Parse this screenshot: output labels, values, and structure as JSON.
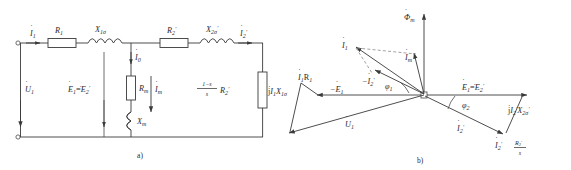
{
  "figure": {
    "caption_a": "a)",
    "caption_b": "b)"
  },
  "circuit": {
    "name": "induction-motor-equivalent-circuit",
    "labels": {
      "i1": "I",
      "i1_sub": "1",
      "r1": "R",
      "r1_sub": "1",
      "x1s": "X",
      "x1s_sub": "1σ",
      "i0": "I",
      "i0_sub": "0",
      "rm": "R",
      "rm_sub": "m",
      "xm": "X",
      "xm_sub": "m",
      "im": "I",
      "im_sub": "m",
      "e1": "E",
      "e1_sub": "1",
      "eq": "=",
      "e2p": "E",
      "e2p_sub": "2",
      "e2p_prime": "′",
      "u1": "U",
      "u1_sub": "1",
      "r2p": "R",
      "r2p_sub": "2",
      "r2p_prime": "′",
      "x2s": "X",
      "x2s_sub": "2σ",
      "x2s_prime": "′",
      "i2p": "I",
      "i2p_sub": "2",
      "i2p_prime": "′",
      "slip_num": "1−s",
      "slip_den": "s",
      "slip_res": "R",
      "slip_res_sub": "2",
      "slip_res_prime": "′"
    }
  },
  "phasor": {
    "name": "induction-motor-phasor-diagram",
    "labels": {
      "phi_m": "Φ",
      "phi_m_sub": "m",
      "i1": "I",
      "i1_sub": "1",
      "im": "I",
      "im_sub": "m",
      "i1r1": "I",
      "i1r1_sub": "1",
      "i1r1_r": "R",
      "i1r1_rsub": "1",
      "jx1s": "j",
      "jx1s_i": "I",
      "jx1s_isub": "1",
      "jx1s_x": "X",
      "jx1s_xsub": "1σ",
      "neg_e1": "−E",
      "neg_e1_sub": "1",
      "neg_i2p": "−I",
      "neg_i2p_sub": "2",
      "neg_i2p_prime": "′",
      "phi1": "φ",
      "phi1_sub": "1",
      "phi2": "φ",
      "phi2_sub": "2",
      "u1": "U",
      "u1_sub": "1",
      "e1e2": "E",
      "e1e2_sub": "1",
      "e1e2_eq": "=",
      "e1e2_e2": "E",
      "e1e2_e2sub": "2",
      "e1e2_prime": "′",
      "jx2s": "j",
      "jx2s_i": "I",
      "jx2s_isub": "2",
      "jx2s_iprime": "′",
      "jx2s_x": "X",
      "jx2s_xsub": "2σ",
      "jx2s_xprime": "′",
      "i2p": "I",
      "i2p_sub": "2",
      "i2p_prime": "′",
      "i2r2s_i": "I",
      "i2r2s_isub": "2",
      "i2r2s_iprime": "′",
      "i2r2s_r": "R",
      "i2r2s_rsub": "2",
      "i2r2s_rprime": "′",
      "i2r2s_den": "s"
    }
  }
}
